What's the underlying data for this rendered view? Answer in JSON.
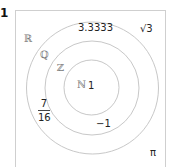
{
  "problem": {
    "number": "1"
  },
  "diagram": {
    "type": "nested-sets-venn",
    "stroke_color": "#c8c8c8",
    "frame_color": "#cfcfcf",
    "sets": [
      {
        "symbol": "ℝ",
        "name": "Real numbers"
      },
      {
        "symbol": "ℚ",
        "name": "Rational numbers"
      },
      {
        "symbol": "ℤ",
        "name": "Integers"
      },
      {
        "symbol": "ℕ",
        "name": "Natural numbers"
      }
    ],
    "elements": {
      "natural": "1",
      "integer": "−1",
      "rational_decimal": "3.3333",
      "rational_fraction": {
        "numerator": "7",
        "denominator": "16"
      },
      "irrational_root": "√3",
      "irrational_pi": "π"
    }
  }
}
